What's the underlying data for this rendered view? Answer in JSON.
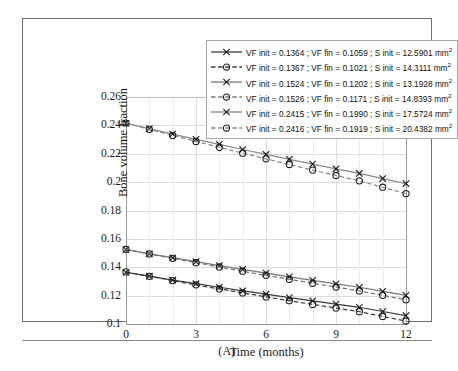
{
  "caption": "(A)",
  "chart_data": {
    "type": "line",
    "title": "",
    "xlabel": "Time (months)",
    "ylabel": "Bone volume fraction",
    "xlim": [
      0,
      12
    ],
    "ylim": [
      0.1,
      0.26
    ],
    "xticks": [
      "0",
      "3",
      "6",
      "9",
      "12"
    ],
    "xtick_values": [
      0,
      3,
      6,
      9,
      12
    ],
    "yticks": [
      "0.1",
      "0.12",
      "0.14",
      "0.16",
      "0.18",
      "0.2",
      "0.22",
      "0.24",
      "0.26"
    ],
    "ytick_values": [
      0.1,
      0.12,
      0.14,
      0.16,
      0.18,
      0.2,
      0.22,
      0.24,
      0.26
    ],
    "grid": true,
    "legend_position": "top-right",
    "x": [
      0,
      1,
      2,
      3,
      4,
      5,
      6,
      7,
      8,
      9,
      10,
      11,
      12
    ],
    "series": [
      {
        "name": "VF init = 0.1364 ; VF fin = 0.1059 ; S init = 12.5901 mm²",
        "vf_init": 0.1364,
        "vf_fin": 0.1059,
        "s_init": 12.5901,
        "s_init_unit": "mm²",
        "line_style": "solid",
        "marker": "x",
        "color": "#3c3c3c",
        "values": [
          0.1364,
          0.1337,
          0.131,
          0.1284,
          0.1259,
          0.1234,
          0.121,
          0.1186,
          0.1163,
          0.114,
          0.1118,
          0.1088,
          0.1059
        ]
      },
      {
        "name": "VF init = 0.1367 ; VF fin = 0.1021 ; S init = 14.3111 mm²",
        "vf_init": 0.1367,
        "vf_fin": 0.1021,
        "s_init": 14.3111,
        "s_init_unit": "mm²",
        "line_style": "dashed",
        "marker": "circle",
        "color": "#3c3c3c",
        "values": [
          0.1367,
          0.1336,
          0.1306,
          0.1276,
          0.1247,
          0.1219,
          0.1191,
          0.1164,
          0.1138,
          0.1112,
          0.1087,
          0.1053,
          0.1021
        ]
      },
      {
        "name": "VF init = 0.1524 ; VF fin = 0.1202 ; S init = 13.1928 mm²",
        "vf_init": 0.1524,
        "vf_fin": 0.1202,
        "s_init": 13.1928,
        "s_init_unit": "mm²",
        "line_style": "solid",
        "marker": "x",
        "color": "#777777",
        "values": [
          0.1524,
          0.1495,
          0.1467,
          0.1439,
          0.1412,
          0.1385,
          0.1359,
          0.1333,
          0.1308,
          0.1283,
          0.1259,
          0.123,
          0.1202
        ]
      },
      {
        "name": "VF init = 0.1526 ; VF fin = 0.1171 ; S init = 14.8393 mm²",
        "vf_init": 0.1526,
        "vf_fin": 0.1171,
        "s_init": 14.8393,
        "s_init_unit": "mm²",
        "line_style": "dashed",
        "marker": "circle",
        "color": "#777777",
        "values": [
          0.1526,
          0.1494,
          0.1463,
          0.1432,
          0.1402,
          0.1372,
          0.1343,
          0.1315,
          0.1287,
          0.126,
          0.1233,
          0.1202,
          0.1171
        ]
      },
      {
        "name": "VF init = 0.2415 ; VF fin = 0.1990 ; S init = 17.5724 mm²",
        "vf_init": 0.2415,
        "vf_fin": 0.199,
        "s_init": 17.5724,
        "s_init_unit": "mm²",
        "line_style": "solid",
        "marker": "x",
        "color": "#8a8a8a",
        "values": [
          0.2415,
          0.2377,
          0.2339,
          0.2302,
          0.2266,
          0.223,
          0.2195,
          0.2161,
          0.2127,
          0.2094,
          0.2061,
          0.2025,
          0.199
        ]
      },
      {
        "name": "VF init = 0.2416 ; VF fin = 0.1919 ; S init = 20.4382 mm²",
        "vf_init": 0.2416,
        "vf_fin": 0.1919,
        "s_init": 20.4382,
        "s_init_unit": "mm²",
        "line_style": "dashed",
        "marker": "circle",
        "color": "#8a8a8a",
        "values": [
          0.2416,
          0.2372,
          0.2329,
          0.2287,
          0.2245,
          0.2204,
          0.2164,
          0.2124,
          0.2085,
          0.2047,
          0.2009,
          0.1964,
          0.1919
        ]
      }
    ]
  }
}
